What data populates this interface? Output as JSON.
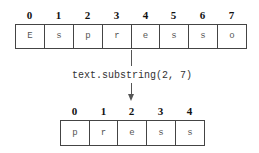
{
  "original": {
    "indices": [
      "0",
      "1",
      "2",
      "3",
      "4",
      "5",
      "6",
      "7"
    ],
    "chars": [
      "E",
      "s",
      "p",
      "r",
      "e",
      "s",
      "s",
      "o"
    ]
  },
  "operation": {
    "label": "text.substring(2, 7)"
  },
  "result": {
    "indices": [
      "0",
      "1",
      "2",
      "3",
      "4"
    ],
    "chars": [
      "p",
      "r",
      "e",
      "s",
      "s"
    ]
  }
}
